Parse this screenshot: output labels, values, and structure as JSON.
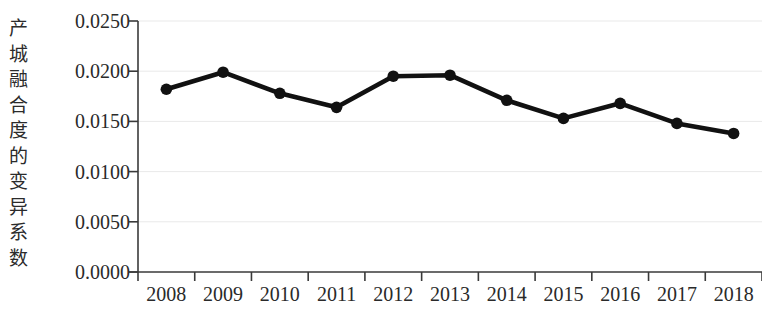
{
  "chart_data": {
    "type": "line",
    "title": "",
    "subtitle": "",
    "xlabel": "",
    "ylabel": "产城融合度的变异系数",
    "categories": [
      "2008",
      "2009",
      "2010",
      "2011",
      "2012",
      "2013",
      "2014",
      "2015",
      "2016",
      "2017",
      "2018"
    ],
    "series": [
      {
        "name": "产城融合度的变异系数",
        "values": [
          0.0182,
          0.0199,
          0.0178,
          0.0164,
          0.0195,
          0.0196,
          0.0171,
          0.0153,
          0.0168,
          0.0148,
          0.0138
        ]
      }
    ],
    "ylim": [
      0.0,
      0.025
    ],
    "ytick_values": [
      0.0,
      0.005,
      0.01,
      0.015,
      0.02,
      0.025
    ],
    "ytick_labels": [
      "0.0000",
      "0.0050",
      "0.0100",
      "0.0150",
      "0.0200",
      "0.0250"
    ],
    "grid": "horizontal",
    "legend": "none",
    "marker": "filled-circle",
    "line_color": "#111111",
    "marker_color": "#111111",
    "grid_color": "#e9e9e9",
    "axis_color": "#3a3a3a",
    "annotations": []
  },
  "axis_title": {
    "chars": [
      "产",
      "城",
      "融",
      "合",
      "度",
      "的",
      "变",
      "异",
      "系",
      "数"
    ],
    "text": "产城融合度的变异系数"
  }
}
